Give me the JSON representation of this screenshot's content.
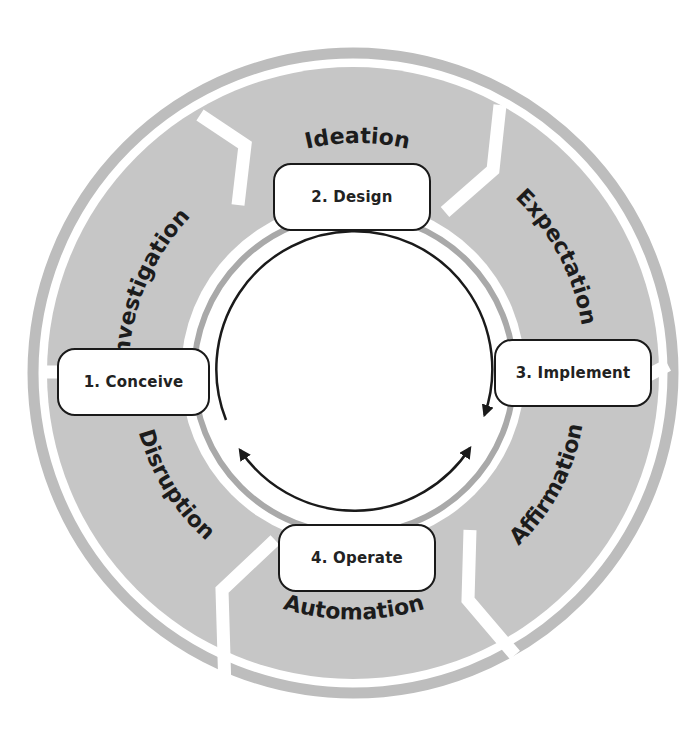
{
  "diagram": {
    "type": "cycle",
    "colors": {
      "segment_fill": "#c6c6c6",
      "outer_ring": "#bdbdbd",
      "inner_ring": "#a9a9a9",
      "arrow": "#1a1a1a",
      "box_border": "#1a1a1a",
      "text": "#1c1c1c",
      "background": "#ffffff"
    },
    "segments": [
      {
        "label": "Investigation"
      },
      {
        "label": "Ideation"
      },
      {
        "label": "Expectation"
      },
      {
        "label": "Affirmation"
      },
      {
        "label": "Automation"
      },
      {
        "label": "Disruption"
      }
    ],
    "stages": [
      {
        "label": "1. Conceive"
      },
      {
        "label": "2. Design"
      },
      {
        "label": "3. Implement"
      },
      {
        "label": "4. Operate"
      }
    ],
    "flow": {
      "top_arc": "clockwise from Conceive through Design to Implement",
      "bottom_arc": "double-headed between Operate side near Conceive and Implement"
    }
  }
}
